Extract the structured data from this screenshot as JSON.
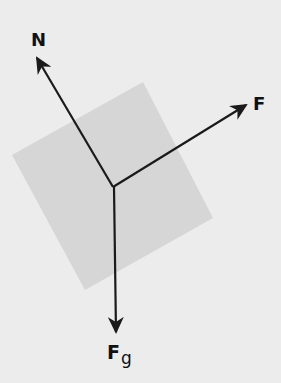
{
  "diagram": {
    "type": "free-body-diagram",
    "background_color": "#ececec",
    "block": {
      "shape": "rotated-square",
      "fill": "#d6d6d6",
      "corners": [
        [
          143,
          82
        ],
        [
          213,
          218
        ],
        [
          85,
          290
        ],
        [
          12,
          155
        ]
      ]
    },
    "origin": [
      113,
      187
    ],
    "forces": [
      {
        "id": "normal",
        "label": "N",
        "subscript": "",
        "tip": [
          36,
          57
        ]
      },
      {
        "id": "applied",
        "label": "F",
        "subscript": "",
        "tip": [
          247,
          104
        ]
      },
      {
        "id": "gravity",
        "label": "F",
        "subscript": "g",
        "tip": [
          116,
          333
        ]
      }
    ],
    "arrow_color": "#1a1a1a"
  }
}
